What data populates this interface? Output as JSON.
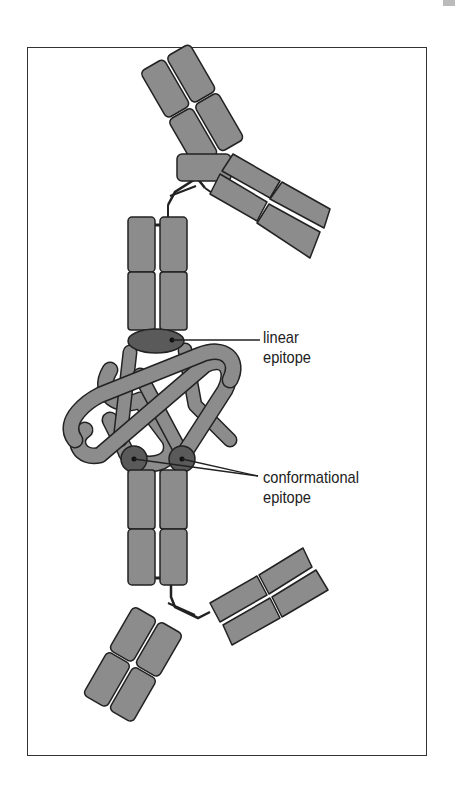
{
  "figure": {
    "labels": {
      "linear": [
        "linear",
        "epitope"
      ],
      "conformational": [
        "conformational",
        "epitope"
      ]
    },
    "colors": {
      "domain_fill": "#8c8c8c",
      "epitope_fill": "#5a5a5a",
      "antigen_fill": "#8c8c8c",
      "outline": "#222222",
      "frame": "#333333"
    }
  }
}
